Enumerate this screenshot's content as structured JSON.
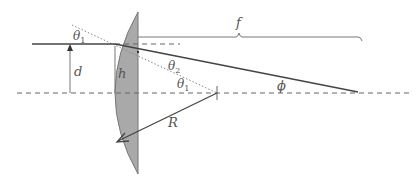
{
  "diagram": {
    "type": "optics-refraction-plano-convex-lens",
    "labels": {
      "theta1_top": {
        "sym": "θ",
        "sub": "1"
      },
      "theta2": {
        "sym": "θ",
        "sub": "2"
      },
      "theta1_center": {
        "sym": "θ",
        "sub": "1"
      },
      "d": "d",
      "h": "h",
      "f": "f",
      "R": "R",
      "phi": "ϕ"
    },
    "colors": {
      "lens_fill": "#a9a9a9",
      "lens_stroke": "#777777",
      "ray": "#444444",
      "axis": "#666666",
      "normal": "#888888",
      "text": "#555555"
    }
  }
}
